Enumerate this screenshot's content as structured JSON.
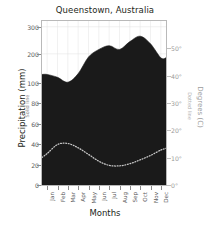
{
  "chart_data": {
    "type": "area",
    "title": "Queenstown, Australia",
    "xlabel": "Months",
    "ylabel": "Precipitation (mm)",
    "ylabel_sub": "Solid line",
    "y2label": "Degrees (C)",
    "y2label_sub": "Dotted line",
    "categories": [
      "Jan",
      "Feb",
      "Mar",
      "Apr",
      "May",
      "Jun",
      "Jul",
      "Aug",
      "Sep",
      "Oct",
      "Nov",
      "Dec"
    ],
    "grid": true,
    "legend": "none",
    "yticks": [
      "0",
      "20",
      "40",
      "60",
      "80",
      "100",
      "200",
      "300"
    ],
    "ytick_values": [
      0,
      20,
      40,
      60,
      80,
      100,
      200,
      300
    ],
    "ylim": [
      0,
      330
    ],
    "y2ticks": [
      "0°",
      "10°",
      "20°",
      "30°",
      "40°",
      "50°"
    ],
    "y2tick_values": [
      0,
      10,
      20,
      30,
      40,
      50
    ],
    "y2lim": [
      0,
      60
    ],
    "series": [
      {
        "name": "Precipitation (mm)",
        "axis": "left",
        "style": "filled-area",
        "color": "#1a1a1a",
        "values": [
          128,
          118,
          101,
          131,
          189,
          216,
          230,
          216,
          245,
          265,
          237,
          186
        ]
      },
      {
        "name": "Degrees (C)",
        "axis": "right",
        "style": "dotted-line",
        "color": "#c9c9c9",
        "values": [
          11.5,
          14.8,
          15.2,
          13.6,
          11.2,
          8.7,
          7.2,
          7.0,
          7.8,
          9.2,
          10.8,
          12.8
        ]
      }
    ]
  }
}
